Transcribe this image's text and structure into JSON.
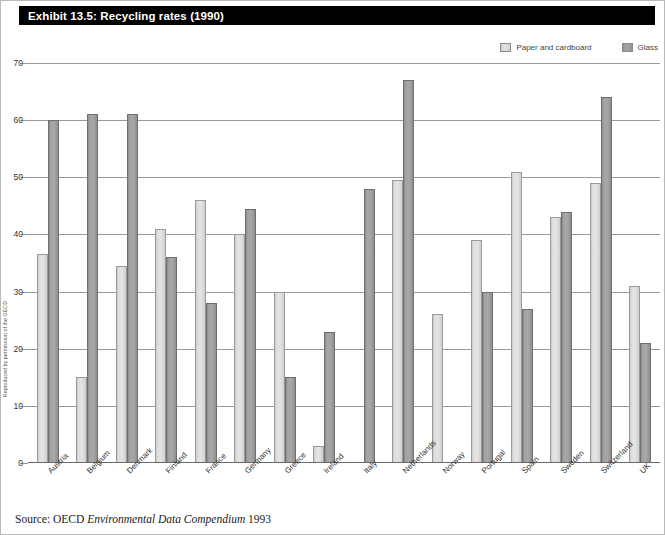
{
  "exhibit": {
    "title": "Exhibit 13.5: Recycling rates (1990)",
    "source_prefix": "Source: OECD ",
    "source_italic": "Environmental Data Compendium",
    "source_suffix": " 1993",
    "side_credit": "Reproduced by permission of the OECD"
  },
  "colors": {
    "title_bar_bg": "#000000",
    "title_text": "#ffffff",
    "paper_fill": "#dedede",
    "glass_fill": "#a2a2a2",
    "gridline": "#9a9a9a",
    "page_bg": "#ffffff"
  },
  "legend": {
    "position": "top-right",
    "items": [
      {
        "label": "Paper and cardboard",
        "swatch": "paper-swatch-icon"
      },
      {
        "label": "Glass",
        "swatch": "glass-swatch-icon"
      }
    ]
  },
  "chart_data": {
    "type": "bar",
    "title": "Exhibit 13.5: Recycling rates (1990)",
    "xlabel": "",
    "ylabel": "",
    "ylim": [
      0,
      70
    ],
    "yticks": [
      0,
      10,
      20,
      30,
      40,
      50,
      60,
      70
    ],
    "grid": true,
    "legend_position": "top-right",
    "categories": [
      "Austria",
      "Belgium",
      "Denmark",
      "Finland",
      "France",
      "Germany",
      "Greece",
      "Ireland",
      "Italy",
      "Netherlands",
      "Norway",
      "Portugal",
      "Spain",
      "Sweden",
      "Switzerland",
      "UK"
    ],
    "series": [
      {
        "name": "Paper and cardboard",
        "values": [
          36.5,
          15,
          34.5,
          41,
          46,
          40,
          30,
          3,
          null,
          49.5,
          26,
          39,
          51,
          43,
          49,
          31
        ]
      },
      {
        "name": "Glass",
        "values": [
          60,
          61,
          61,
          36,
          28,
          44.5,
          15,
          23,
          48,
          67,
          null,
          30,
          27,
          44,
          64,
          21
        ]
      }
    ]
  }
}
